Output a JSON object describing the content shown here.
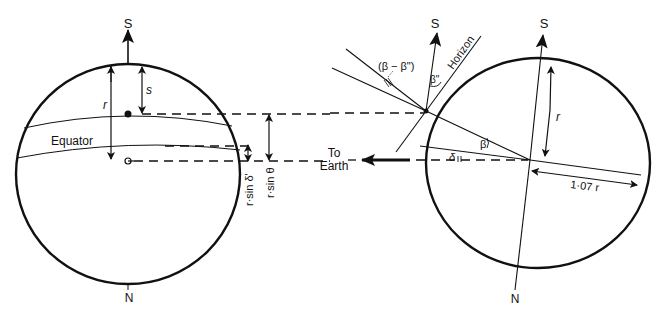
{
  "diagram": {
    "left_sphere": {
      "pole_top": "S",
      "pole_bottom": "N",
      "radius_label": "r",
      "s_label": "s",
      "equator_label": "Equator",
      "r_sin_delta_label": "r·sin δ'",
      "r_sin_theta_label": "r·sin θ"
    },
    "right_sphere": {
      "pole_top_left": "S",
      "pole_top_right": "S",
      "pole_bottom": "N",
      "radius_label": "r",
      "horizon_label": "Horizon",
      "beta_double_prime": "β\"",
      "beta_diff": "(β − β\")",
      "beta": "β",
      "delta": "δ",
      "distance_label": "1·07 r"
    },
    "earth_direction": {
      "line1": "To",
      "line2": "Earth"
    }
  }
}
